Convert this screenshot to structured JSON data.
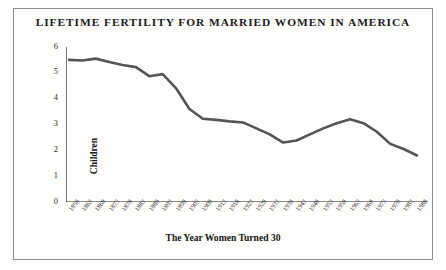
{
  "chart_data": {
    "type": "line",
    "title": "LIFETIME FERTILITY FOR MARRIED WOMEN IN AMERICA",
    "xlabel": "The Year Women Turned 30",
    "ylabel": "Children",
    "ylim": [
      0,
      6
    ],
    "yticks": [
      0,
      1,
      2,
      3,
      4,
      5,
      6
    ],
    "ytick_labels": [
      "0",
      "1",
      "2",
      "3",
      "4",
      "5",
      "6"
    ],
    "grid": false,
    "legend": "none",
    "line_color": "#555555",
    "categories": [
      "1858",
      "1863",
      "1868",
      "1873",
      "1878",
      "1883",
      "1888",
      "1893",
      "1898",
      "1903",
      "1908",
      "1913",
      "1918",
      "1923",
      "1928",
      "1933",
      "1938",
      "1943",
      "1948",
      "1953",
      "1958",
      "1963",
      "1968",
      "1973",
      "1978",
      "1983",
      "1988"
    ],
    "values": [
      5.5,
      5.48,
      5.55,
      5.42,
      5.3,
      5.22,
      4.87,
      4.95,
      4.4,
      3.6,
      3.22,
      3.18,
      3.12,
      3.08,
      2.85,
      2.62,
      2.3,
      2.38,
      2.62,
      2.85,
      3.05,
      3.2,
      3.05,
      2.72,
      2.25,
      2.05,
      1.8
    ],
    "xlim_years": [
      1858,
      1988
    ]
  },
  "axis": {
    "y_title": "Children",
    "x_title": "The Year Women Turned 30"
  }
}
